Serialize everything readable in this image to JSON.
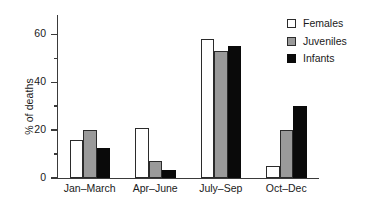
{
  "chart_data": {
    "type": "bar",
    "title": "",
    "subtitle": "",
    "xlabel": "",
    "ylabel": "% of deaths",
    "categories": [
      "Jan–March",
      "Apr–June",
      "July–Sep",
      "Oct–Dec"
    ],
    "series": [
      {
        "name": "Females",
        "values": [
          16,
          21,
          58,
          5
        ],
        "color": "#ffffff"
      },
      {
        "name": "Juveniles",
        "values": [
          20,
          7,
          53,
          20
        ],
        "color": "#9a9a9a"
      },
      {
        "name": "Infants",
        "values": [
          12.5,
          3.5,
          55,
          30
        ],
        "color": "#0a0a0a"
      }
    ],
    "ylim": [
      0,
      68
    ],
    "yticks_major": [
      0,
      20,
      40,
      60
    ],
    "yticks_major_labels": [
      "0",
      "20",
      "40",
      "60"
    ],
    "yticks_minor": [
      10,
      30,
      50
    ],
    "grid": false,
    "legend_position": "top-right",
    "legend_entries": [
      "Females",
      "Juveniles",
      "Infants"
    ]
  },
  "legend": {
    "items": [
      {
        "label": "Females"
      },
      {
        "label": "Juveniles"
      },
      {
        "label": "Infants"
      }
    ]
  },
  "axes": {
    "y_title": "% of deaths"
  }
}
